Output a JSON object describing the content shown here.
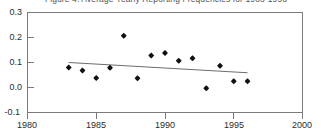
{
  "chart_data": {
    "type": "scatter",
    "title": "Figure 4. Average Yearly Reporting Frequencies for 1983-1996",
    "xlabel": "",
    "ylabel": "",
    "xlim": [
      1980,
      2000
    ],
    "ylim": [
      -0.1,
      0.3
    ],
    "grid": false,
    "legend": null,
    "x_ticks": [
      1980,
      1985,
      1990,
      1995,
      2000
    ],
    "x_tick_labels": [
      "1980",
      "1985",
      "1990",
      "1995",
      "2000"
    ],
    "y_ticks": [
      -0.1,
      0.0,
      0.1,
      0.2,
      0.3
    ],
    "y_tick_labels": [
      "-0.1",
      "0.0",
      "0.1",
      "0.2",
      "0.3"
    ],
    "marker_color": "#111111",
    "trend_color": "#6d6d6d",
    "axis_color": "#7a7a7a",
    "series": [
      {
        "name": "Average yearly reporting frequency",
        "marker": "filled-diamond",
        "x": [
          1983,
          1984,
          1985,
          1986,
          1987,
          1988,
          1989,
          1990,
          1991,
          1992,
          1993,
          1994,
          1995,
          1996
        ],
        "y": [
          0.08,
          0.068,
          0.038,
          0.079,
          0.207,
          0.037,
          0.128,
          0.138,
          0.107,
          0.117,
          -0.003,
          0.087,
          0.025,
          0.025
        ]
      }
    ],
    "trend": {
      "name": "Linear trend",
      "x": [
        1983,
        1996
      ],
      "y": [
        0.1,
        0.059
      ]
    }
  }
}
